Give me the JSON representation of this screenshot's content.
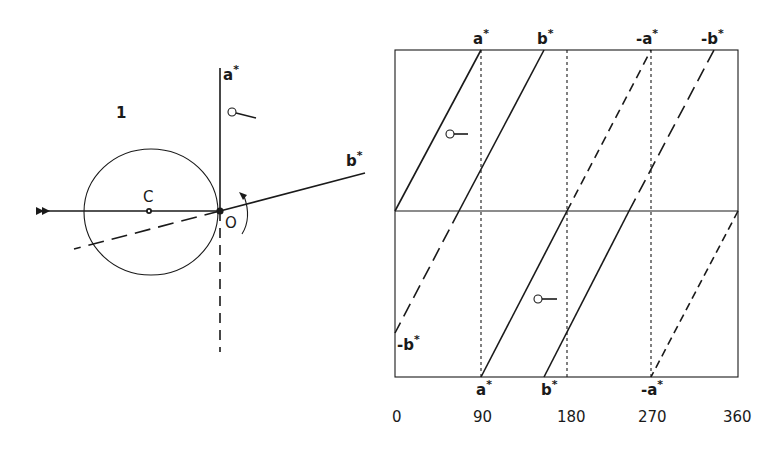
{
  "left_panel": {
    "figure_number": "1",
    "labels": {
      "a_star": "a",
      "b_star": "b",
      "star": "*",
      "origin": "O",
      "center": "C"
    },
    "elements": {
      "sphere": "Ewald circle",
      "incident_beam": "arrowed horizontal line",
      "rotation_arrow": "curved arrow at O",
      "goniometer_symbol": "o—"
    }
  },
  "right_panel": {
    "top_labels": [
      "a",
      "b",
      "-a",
      "-b"
    ],
    "bottom_labels": [
      "a",
      "b",
      "-a"
    ],
    "left_label": "-b",
    "star": "*",
    "x_ticks": [
      "0",
      "90",
      "180",
      "270",
      "360"
    ],
    "goniometer_symbol": "o—"
  }
}
